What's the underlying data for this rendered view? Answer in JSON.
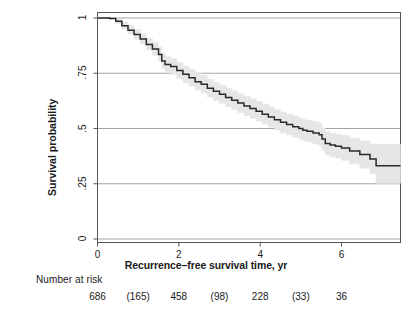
{
  "chart_data": {
    "type": "line",
    "title": "",
    "xlabel": "Recurrence–free survival time, yr",
    "ylabel": "Survival probability",
    "xlim": [
      0,
      7.45
    ],
    "ylim": [
      0,
      1
    ],
    "xticks": [
      0,
      2,
      4,
      6
    ],
    "xtick_labels": [
      "0",
      "2",
      "4",
      "6"
    ],
    "yticks": [
      0,
      0.25,
      0.5,
      0.75,
      1
    ],
    "ytick_labels": [
      "0",
      ".25",
      ".5",
      ".75",
      "1"
    ],
    "grid": "horizontal",
    "legend": "none",
    "colors": {
      "curve": "#2a2a2a",
      "confidence_band": "#e6e6e6",
      "gridline": "#9a9a9a",
      "axis": "#555555",
      "background": "#ffffff"
    },
    "series": [
      {
        "name": "Recurrence-free survival",
        "style": "step",
        "x": [
          0.0,
          0.3,
          0.45,
          0.6,
          0.75,
          0.9,
          1.05,
          1.2,
          1.35,
          1.5,
          1.58,
          1.66,
          1.8,
          1.95,
          2.1,
          2.25,
          2.4,
          2.55,
          2.7,
          2.85,
          3.0,
          3.15,
          3.3,
          3.45,
          3.6,
          3.75,
          3.9,
          4.05,
          4.2,
          4.35,
          4.5,
          4.65,
          4.8,
          4.95,
          5.05,
          5.15,
          5.3,
          5.45,
          5.52,
          5.6,
          5.72,
          5.85,
          6.0,
          6.2,
          6.45,
          6.7,
          6.85,
          7.45
        ],
        "y": [
          1.0,
          0.998,
          0.985,
          0.965,
          0.945,
          0.925,
          0.905,
          0.88,
          0.86,
          0.835,
          0.805,
          0.79,
          0.78,
          0.762,
          0.745,
          0.73,
          0.712,
          0.7,
          0.682,
          0.668,
          0.655,
          0.64,
          0.628,
          0.615,
          0.602,
          0.59,
          0.578,
          0.565,
          0.552,
          0.54,
          0.528,
          0.518,
          0.508,
          0.5,
          0.492,
          0.488,
          0.48,
          0.472,
          0.452,
          0.432,
          0.425,
          0.42,
          0.412,
          0.398,
          0.382,
          0.362,
          0.332,
          0.332
        ]
      }
    ],
    "confidence_band": {
      "label": "95% CI",
      "upper": [
        1.0,
        1.0,
        0.995,
        0.982,
        0.965,
        0.948,
        0.93,
        0.908,
        0.89,
        0.868,
        0.84,
        0.825,
        0.815,
        0.798,
        0.782,
        0.768,
        0.752,
        0.74,
        0.722,
        0.708,
        0.696,
        0.682,
        0.67,
        0.658,
        0.645,
        0.634,
        0.622,
        0.61,
        0.598,
        0.586,
        0.575,
        0.565,
        0.556,
        0.548,
        0.54,
        0.536,
        0.53,
        0.522,
        0.503,
        0.485,
        0.478,
        0.474,
        0.468,
        0.456,
        0.444,
        0.43,
        0.428,
        0.428
      ],
      "lower": [
        1.0,
        0.994,
        0.975,
        0.95,
        0.928,
        0.904,
        0.882,
        0.855,
        0.832,
        0.805,
        0.772,
        0.756,
        0.746,
        0.726,
        0.708,
        0.692,
        0.674,
        0.66,
        0.642,
        0.628,
        0.614,
        0.598,
        0.586,
        0.572,
        0.559,
        0.546,
        0.534,
        0.52,
        0.506,
        0.494,
        0.481,
        0.471,
        0.46,
        0.452,
        0.444,
        0.44,
        0.43,
        0.422,
        0.401,
        0.38,
        0.372,
        0.366,
        0.356,
        0.34,
        0.32,
        0.296,
        0.252,
        0.252
      ]
    },
    "annotations": {
      "risk_table_title": "Number at risk",
      "risk_table_x": [
        0,
        1,
        2,
        3,
        4,
        5,
        6
      ],
      "risk_table_values": [
        "686",
        "(165)",
        "458",
        "(98)",
        "228",
        "(33)",
        "36"
      ]
    }
  }
}
